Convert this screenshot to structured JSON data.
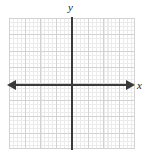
{
  "figure": {
    "type": "coordinate-plane",
    "title": "",
    "width": 147,
    "height": 160,
    "background_color": "#ffffff"
  },
  "axes": {
    "x_label": "x",
    "y_label": "y",
    "axis_color": "#3a3a3a",
    "origin": {
      "x": 72,
      "y": 85
    },
    "x_axis": {
      "arrow_left": true,
      "arrow_right": true,
      "start_px": 8,
      "end_px": 135
    },
    "y_axis": {
      "arrow_top": false,
      "arrow_bottom": false,
      "start_px": 17,
      "end_px": 150
    }
  },
  "grid": {
    "major_color": "#d2d2d2",
    "minor_color": "#ebebeb",
    "major_columns": 8,
    "major_rows": 8,
    "minor_per_major": 4,
    "left_px": 9,
    "top_px": 18,
    "width_px": 126,
    "height_px": 131,
    "tick_labels_visible": false
  },
  "chart_data": {
    "type": "scatter",
    "title": "",
    "xlabel": "x",
    "ylabel": "y",
    "xlim": [
      -4,
      4
    ],
    "ylim": [
      -4,
      4
    ],
    "xticks": [
      -4,
      -3,
      -2,
      -1,
      0,
      1,
      2,
      3,
      4
    ],
    "yticks": [
      -4,
      -3,
      -2,
      -1,
      0,
      1,
      2,
      3,
      4
    ],
    "xtick_labels": [
      "",
      "",
      "",
      "",
      "",
      "",
      "",
      "",
      ""
    ],
    "ytick_labels": [
      "",
      "",
      "",
      "",
      "",
      "",
      "",
      "",
      ""
    ],
    "grid": true,
    "minor_grid": true,
    "minor_ticks_per_major": 4,
    "legend": null,
    "series": [],
    "annotations": [],
    "note": "Empty blank coordinate plane / graph paper; no data plotted."
  }
}
